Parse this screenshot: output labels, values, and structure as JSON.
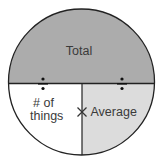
{
  "diagram": {
    "type": "formula-triangle-circle",
    "colors": {
      "top_fill": "#acacac",
      "bottom_left_fill": "#ffffff",
      "bottom_right_fill": "#dcdcdc",
      "line": "#222222",
      "text": "#3a3a3a"
    },
    "sections": {
      "top": {
        "label": "Total"
      },
      "bottom_left": {
        "label_line1": "# of",
        "label_line2": "things"
      },
      "bottom_right": {
        "label": "Average"
      }
    },
    "operators": {
      "left_divide": "÷",
      "right_divide": "÷",
      "multiply": "×"
    }
  }
}
